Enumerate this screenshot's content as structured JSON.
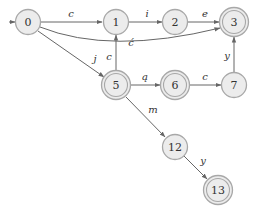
{
  "diagram": {
    "type": "finite-state-automaton",
    "start_state": "0",
    "nodes": [
      {
        "id": "0",
        "label": "0",
        "x": 28,
        "y": 22,
        "accepting": false
      },
      {
        "id": "1",
        "label": "1",
        "x": 116,
        "y": 22,
        "accepting": false
      },
      {
        "id": "2",
        "label": "2",
        "x": 175,
        "y": 22,
        "accepting": false
      },
      {
        "id": "3",
        "label": "3",
        "x": 234,
        "y": 22,
        "accepting": true
      },
      {
        "id": "5",
        "label": "5",
        "x": 116,
        "y": 85,
        "accepting": true
      },
      {
        "id": "6",
        "label": "6",
        "x": 175,
        "y": 85,
        "accepting": true
      },
      {
        "id": "7",
        "label": "7",
        "x": 234,
        "y": 85,
        "accepting": false
      },
      {
        "id": "12",
        "label": "12",
        "x": 175,
        "y": 147,
        "accepting": false
      },
      {
        "id": "13",
        "label": "13",
        "x": 218,
        "y": 190,
        "accepting": true
      }
    ],
    "edges": [
      {
        "from": "0",
        "to": "1",
        "label": "c"
      },
      {
        "from": "0",
        "to": "5",
        "label": "j"
      },
      {
        "from": "0",
        "to": "3",
        "label": "ć"
      },
      {
        "from": "1",
        "to": "2",
        "label": "i"
      },
      {
        "from": "2",
        "to": "3",
        "label": "e"
      },
      {
        "from": "5",
        "to": "1",
        "label": "c"
      },
      {
        "from": "5",
        "to": "6",
        "label": "ą"
      },
      {
        "from": "6",
        "to": "7",
        "label": "c"
      },
      {
        "from": "7",
        "to": "3",
        "label": "y"
      },
      {
        "from": "5",
        "to": "12",
        "label": "m"
      },
      {
        "from": "12",
        "to": "13",
        "label": "y"
      }
    ]
  },
  "labels": {
    "n0": "0",
    "n1": "1",
    "n2": "2",
    "n3": "3",
    "n5": "5",
    "n6": "6",
    "n7": "7",
    "n12": "12",
    "n13": "13",
    "e_0_1": "c",
    "e_0_5": "j",
    "e_0_3": "ć",
    "e_1_2": "i",
    "e_2_3": "e",
    "e_5_1": "c",
    "e_5_6": "ą",
    "e_6_7": "c",
    "e_7_3": "y",
    "e_5_12": "m",
    "e_12_13": "y"
  },
  "colors": {
    "node_fill": "#ececec",
    "node_stroke": "#a8a8a8",
    "edge": "#666666",
    "text": "#333333"
  }
}
